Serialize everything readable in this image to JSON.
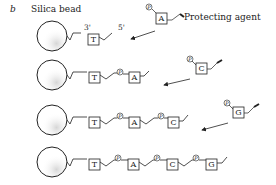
{
  "panel_label": "b",
  "title": "Silica bead",
  "prime_labels": {
    "three_prime": "3'",
    "five_prime": "5'"
  },
  "protecting_agent_label": "Protecting agent",
  "phosphate_symbol": "P",
  "rows": [
    {
      "chain": [
        "T"
      ],
      "incoming": "A"
    },
    {
      "chain": [
        "T",
        "A"
      ],
      "incoming": "C"
    },
    {
      "chain": [
        "T",
        "A",
        "C"
      ],
      "incoming": "G"
    },
    {
      "chain": [
        "T",
        "A",
        "C",
        "G"
      ],
      "incoming": null
    }
  ],
  "colors": {
    "line": "#222222",
    "background": "#ffffff"
  }
}
